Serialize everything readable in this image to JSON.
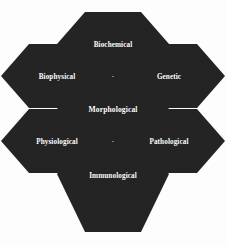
{
  "diagram": {
    "type": "honeycomb",
    "title": "",
    "background_color": "#ffffff",
    "hex_fill_color": "#232323",
    "hex_bevel_color": "#c9c9c9",
    "label_color": "#ffffff",
    "cells": [
      {
        "id": "biochemical",
        "label": "Biochemical",
        "position": "top",
        "cx": 113,
        "cy": 44
      },
      {
        "id": "biophysical",
        "label": "Biophysical",
        "position": "upper-left",
        "cx": 57,
        "cy": 76
      },
      {
        "id": "genetic",
        "label": "Genetic",
        "position": "upper-right",
        "cx": 169,
        "cy": 76
      },
      {
        "id": "morphological",
        "label": "Morphological",
        "position": "center",
        "cx": 113,
        "cy": 109
      },
      {
        "id": "physiological",
        "label": "Physiological",
        "position": "lower-left",
        "cx": 57,
        "cy": 141
      },
      {
        "id": "pathological",
        "label": "Pathological",
        "position": "lower-right",
        "cx": 169,
        "cy": 141
      },
      {
        "id": "immunological",
        "label": "Immunological",
        "position": "bottom",
        "cx": 113,
        "cy": 174
      }
    ]
  }
}
